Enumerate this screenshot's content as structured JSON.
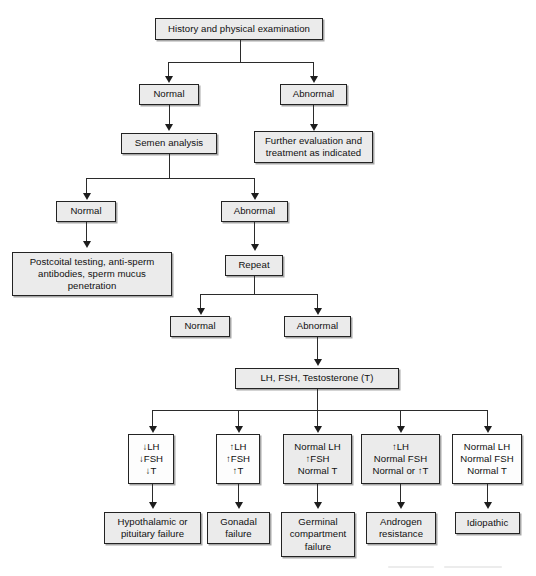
{
  "diagram": {
    "title": "History and physical examination",
    "type": "clinical-algorithm-flowchart"
  },
  "nodes": {
    "history": "History and physical examination",
    "normal_1": "Normal",
    "abnormal_1": "Abnormal",
    "semen_analysis": "Semen analysis",
    "further_eval_l1": "Further evaluation and",
    "further_eval_l2": "treatment as indicated",
    "normal_2": "Normal",
    "abnormal_2": "Abnormal",
    "postcoital_l1": "Postcoital testing, anti-sperm",
    "postcoital_l2": "antibodies, sperm mucus",
    "postcoital_l3": "penetration",
    "repeat": "Repeat",
    "normal_3": "Normal",
    "abnormal_3": "Abnormal",
    "hormones": "LH, FSH, Testosterone (T)",
    "panel_1_l1": "↓LH",
    "panel_1_l2": "↓FSH",
    "panel_1_l3": "↓T",
    "panel_2_l1": "↑LH",
    "panel_2_l2": "↑FSH",
    "panel_2_l3": "↑T",
    "panel_3_l1": "Normal LH",
    "panel_3_l2": "↑FSH",
    "panel_3_l3": "Normal T",
    "panel_4_l1": "↑LH",
    "panel_4_l2": "Normal FSH",
    "panel_4_l3": "Normal or ↑T",
    "panel_5_l1": "Normal LH",
    "panel_5_l2": "Normal FSH",
    "panel_5_l3": "Normal T",
    "dx_1_l1": "Hypothalamic or",
    "dx_1_l2": "pituitary failure",
    "dx_2_l1": "Gonadal",
    "dx_2_l2": "failure",
    "dx_3_l1": "Germinal",
    "dx_3_l2": "compartment",
    "dx_3_l3": "failure",
    "dx_4_l1": "Androgen",
    "dx_4_l2": "resistance",
    "dx_5": "Idiopathic"
  },
  "colors": {
    "box_fill_shaded": "#ebebeb",
    "box_fill_white": "#fdfdfd",
    "box_border": "#232323",
    "connector": "#2b2b2b",
    "text": "#101010",
    "background": "#ffffff"
  }
}
